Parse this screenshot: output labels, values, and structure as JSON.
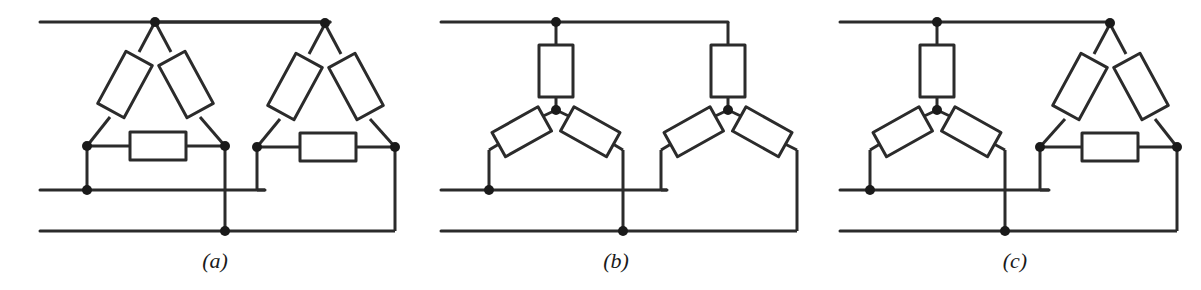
{
  "figure": {
    "background_color": "#ffffff",
    "line_color": "#2b2b2b",
    "node_color": "#1a1a1a",
    "width": 1201,
    "height": 290
  },
  "panels": [
    {
      "id": "a",
      "caption": "(a)",
      "left_winding": "delta",
      "right_winding": "delta",
      "description": "Delta-delta connection"
    },
    {
      "id": "b",
      "caption": "(b)",
      "left_winding": "wye",
      "right_winding": "wye",
      "description": "Wye-wye connection"
    },
    {
      "id": "c",
      "caption": "(c)",
      "left_winding": "wye",
      "right_winding": "delta",
      "description": "Wye-delta connection"
    }
  ],
  "buses": {
    "top_label": "line A",
    "middle_label": "line B",
    "bottom_label": "line C",
    "count": 3
  },
  "components": {
    "resistor_count_per_group": 3,
    "symbol": "rectangle-winding"
  }
}
